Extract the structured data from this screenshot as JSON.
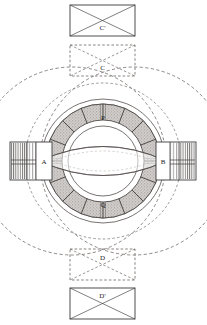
{
  "figure": {
    "kind": "technical-line-diagram",
    "background_color": "#ffffff",
    "line_color": "#3a3a3a",
    "dashed_line_color": "#55504e",
    "shading_color": "#9a9490",
    "label_color": "#1a1a1a"
  },
  "labels": {
    "pole_top_outer": "C'",
    "pole_top_inner": "C",
    "pole_left": "A",
    "pole_right": "B",
    "ring_top": "P",
    "ring_bottom": "Q",
    "pole_bottom_inner": "D",
    "pole_bottom_outer": "D'"
  },
  "parts": [
    {
      "id": "rect-c-prime",
      "label": "C'",
      "style": "solid",
      "diagonals": true,
      "x": 70,
      "y": 5,
      "w": 65,
      "h": 31
    },
    {
      "id": "rect-c",
      "label": "C",
      "style": "dashed",
      "diagonals": true,
      "x": 70,
      "y": 45,
      "w": 65,
      "h": 31
    },
    {
      "id": "rect-d",
      "label": "D",
      "style": "dashed",
      "diagonals": true,
      "x": 70,
      "y": 249,
      "w": 65,
      "h": 31
    },
    {
      "id": "rect-d-prime",
      "label": "D'",
      "style": "solid",
      "diagonals": true,
      "x": 70,
      "y": 288,
      "w": 65,
      "h": 31
    },
    {
      "id": "block-a",
      "label": "A",
      "style": "solid",
      "hatched": "left",
      "x": 10,
      "y": 142,
      "w": 42,
      "h": 38
    },
    {
      "id": "block-b",
      "label": "B",
      "style": "solid",
      "hatched": "right",
      "x": 156,
      "y": 142,
      "w": 40,
      "h": 38
    }
  ],
  "ring": {
    "center_x": 103,
    "center_y": 161,
    "outer_radius": 62,
    "shaded_outer_radius": 57,
    "shaded_inner_radius": 41,
    "inner_radius": 35,
    "segment_count": 16,
    "shaded": true
  },
  "flux_circles": [
    {
      "cx": 72,
      "cy": 161,
      "r": 94,
      "style": "dashed"
    },
    {
      "cx": 134,
      "cy": 161,
      "r": 94,
      "style": "dashed"
    },
    {
      "cx": 103,
      "cy": 161,
      "r": 78,
      "style": "dashed"
    }
  ],
  "lens_arcs": {
    "description": "two symmetric arcs forming a lens/eye shape across the ring aperture",
    "left_x": 40,
    "right_x": 166,
    "center_y": 161,
    "bulge": 26
  }
}
